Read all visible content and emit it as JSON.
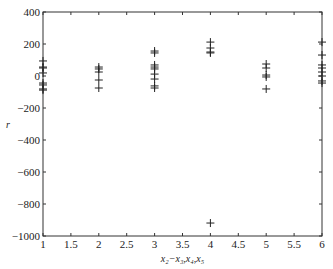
{
  "chart_data": {
    "type": "scatter",
    "title": "",
    "xlabel": "x₂−x₃,x₄,x₅",
    "ylabel": "r",
    "xlim": [
      1,
      6
    ],
    "ylim": [
      -1000,
      400
    ],
    "xticks": [
      1,
      1.5,
      2,
      2.5,
      3,
      3.5,
      4,
      4.5,
      5,
      5.5,
      6
    ],
    "xtick_labels": [
      "1",
      "1.5",
      "2",
      "2.5",
      "3",
      "3.5",
      "4",
      "4.5",
      "5",
      "5.5",
      "6"
    ],
    "yticks": [
      400,
      200,
      0,
      -200,
      -400,
      -600,
      -800,
      -1000
    ],
    "ytick_labels": [
      "400",
      "200",
      "0",
      "−200",
      "−400",
      "−600",
      "−800",
      "−1000"
    ],
    "grid": false,
    "marker": "+",
    "series": [
      {
        "name": "r",
        "points": [
          [
            1,
            94
          ],
          [
            1,
            56
          ],
          [
            1,
            50
          ],
          [
            1,
            19
          ],
          [
            1,
            -44
          ],
          [
            1,
            -56
          ],
          [
            1,
            -81
          ],
          [
            1,
            -88
          ],
          [
            2,
            56
          ],
          [
            2,
            44
          ],
          [
            2,
            25
          ],
          [
            2,
            -25
          ],
          [
            2,
            -75
          ],
          [
            3,
            156
          ],
          [
            3,
            144
          ],
          [
            3,
            69
          ],
          [
            3,
            56
          ],
          [
            3,
            44
          ],
          [
            3,
            12
          ],
          [
            3,
            -19
          ],
          [
            3,
            -62
          ],
          [
            3,
            -75
          ],
          [
            4,
            212
          ],
          [
            4,
            175
          ],
          [
            4,
            150
          ],
          [
            4,
            144
          ],
          [
            4,
            -919
          ],
          [
            5,
            75
          ],
          [
            5,
            50
          ],
          [
            5,
            6
          ],
          [
            5,
            -6
          ],
          [
            5,
            -81
          ],
          [
            6,
            212
          ],
          [
            6,
            131
          ],
          [
            6,
            69
          ],
          [
            6,
            50
          ],
          [
            6,
            25
          ],
          [
            6,
            0
          ],
          [
            6,
            -31
          ],
          [
            6,
            -44
          ]
        ]
      }
    ]
  }
}
